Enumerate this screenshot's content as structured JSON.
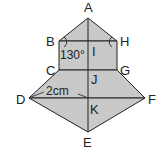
{
  "diagram": {
    "type": "geometry-figure",
    "fill_color": "#c9c9c9",
    "stroke_color": "#222222",
    "points": {
      "A": {
        "label": "A",
        "x": 88,
        "y": 18,
        "lx": 88,
        "ly": 12
      },
      "B": {
        "label": "B",
        "x": 59,
        "y": 41,
        "lx": 48,
        "ly": 45
      },
      "H": {
        "label": "H",
        "x": 117,
        "y": 41,
        "lx": 124,
        "ly": 45
      },
      "I": {
        "label": "I",
        "x": 88,
        "y": 41,
        "lx": 94,
        "ly": 56
      },
      "C": {
        "label": "C",
        "x": 59,
        "y": 70,
        "lx": 48,
        "ly": 74
      },
      "G": {
        "label": "G",
        "x": 117,
        "y": 70,
        "lx": 124,
        "ly": 74
      },
      "J": {
        "label": "J",
        "x": 88,
        "y": 70,
        "lx": 94,
        "ly": 83
      },
      "D": {
        "label": "D",
        "x": 29,
        "y": 98,
        "lx": 16,
        "ly": 103
      },
      "F": {
        "label": "F",
        "x": 145,
        "y": 98,
        "lx": 150,
        "ly": 103
      },
      "K": {
        "label": "K",
        "x": 88,
        "y": 98,
        "lx": 94,
        "ly": 113
      },
      "E": {
        "label": "E",
        "x": 88,
        "y": 132,
        "lx": 87,
        "ly": 146
      }
    },
    "angle_label": "130°",
    "length_label": "2cm",
    "segments": [
      "AB",
      "AH",
      "BH",
      "BC",
      "HG",
      "CG",
      "CD",
      "GF",
      "DF",
      "DE",
      "FE",
      "AE"
    ]
  }
}
